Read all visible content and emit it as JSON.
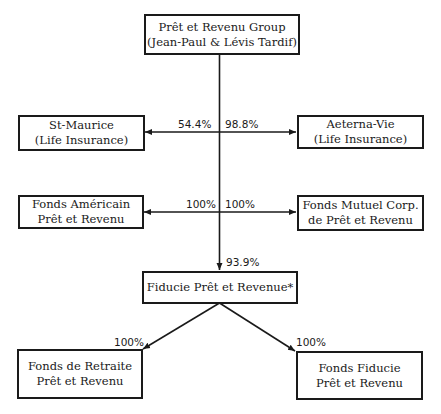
{
  "diagram": {
    "type": "ownership-structure",
    "nodes": {
      "parent": {
        "line1": "Prêt et Revenu Group",
        "line2": "(Jean-Paul & Lévis Tardif)"
      },
      "st_maurice": {
        "line1": "St-Maurice",
        "line2": "(Life Insurance)"
      },
      "aeterna": {
        "line1": "Aeterna-Vie",
        "line2": "(Life Insurance)"
      },
      "fonds_americain": {
        "line1": "Fonds Américain",
        "line2": "Prêt et Revenu"
      },
      "fonds_mutuel": {
        "line1": "Fonds Mutuel Corp.",
        "line2": "de Prêt et Revenu"
      },
      "fiducie": {
        "line1": "Fiducie Prêt et Revenue*"
      },
      "fonds_retraite": {
        "line1": "Fonds de Retraite",
        "line2": "Prêt et Revenu"
      },
      "fonds_fiducie": {
        "line1": "Fonds Fiducie",
        "line2": "Prêt et Revenu"
      }
    },
    "edges": [
      {
        "from": "parent",
        "to": "st_maurice",
        "label": "54.4%"
      },
      {
        "from": "parent",
        "to": "aeterna",
        "label": "98.8%"
      },
      {
        "from": "parent",
        "to": "fonds_americain",
        "label": "100%"
      },
      {
        "from": "parent",
        "to": "fonds_mutuel",
        "label": "100%"
      },
      {
        "from": "parent",
        "to": "fiducie",
        "label": "93.9%"
      },
      {
        "from": "fiducie",
        "to": "fonds_retraite",
        "label": "100%"
      },
      {
        "from": "fiducie",
        "to": "fonds_fiducie",
        "label": "100%"
      }
    ]
  }
}
